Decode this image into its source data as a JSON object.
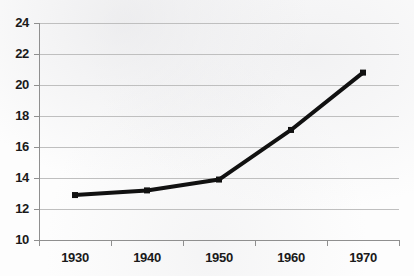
{
  "chart_data": {
    "type": "line",
    "title": "",
    "subtitle": "",
    "xlabel": "",
    "ylabel": "",
    "categories": [
      "1930",
      "1940",
      "1950",
      "1960",
      "1970"
    ],
    "x": [
      1930,
      1940,
      1950,
      1960,
      1970
    ],
    "values": [
      12.9,
      13.2,
      13.9,
      17.1,
      20.8
    ],
    "series": [
      {
        "name": "",
        "values": [
          12.9,
          13.2,
          13.9,
          17.1,
          20.8
        ]
      }
    ],
    "ylim": [
      10,
      24
    ],
    "xlim": [
      1925,
      1975
    ],
    "y_ticks": [
      10,
      12,
      14,
      16,
      18,
      20,
      22,
      24
    ],
    "y_tick_labels": [
      "10",
      "12",
      "14",
      "16",
      "18",
      "20",
      "22",
      "24"
    ],
    "x_tick_labels": [
      "1930",
      "1940",
      "1950",
      "1960",
      "1970"
    ],
    "grid": true,
    "grid_axis": "y",
    "legend": false,
    "legend_position": "none",
    "annotations": [],
    "marker": "square",
    "line_width": 4
  },
  "style": {
    "line_color": "#111111",
    "marker_color": "#111111",
    "grid_color": "#bfbfbf",
    "axis_color": "#8f8f8f",
    "text_color": "#1a1a1a",
    "background": "#fdfdfd"
  },
  "geometry": {
    "plot_left": 39,
    "plot_right": 399,
    "plot_top": 23,
    "plot_bottom": 240
  }
}
